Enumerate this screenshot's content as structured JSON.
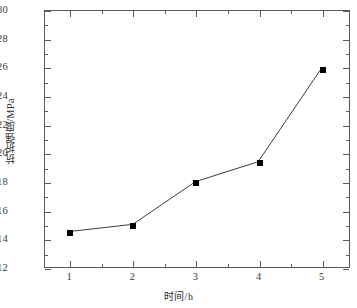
{
  "chart_data": {
    "type": "line",
    "title": "",
    "xlabel": "时间/h",
    "ylabel": "抗折强度/MPa",
    "x": [
      1,
      2,
      3,
      4,
      5
    ],
    "values": [
      14.5,
      15.0,
      18.0,
      19.4,
      25.9
    ],
    "series": [
      {
        "name": "抗折强度",
        "values": [
          14.5,
          15.0,
          18.0,
          19.4,
          25.9
        ]
      }
    ],
    "xlim": [
      0.6,
      5.45
    ],
    "ylim": [
      12,
      30
    ],
    "x_ticks": [
      1,
      2,
      3,
      4,
      5
    ],
    "x_tick_labels": [
      "1",
      "2",
      "3",
      "4",
      "5"
    ],
    "x_minor_ticks": [
      1.5,
      2.5,
      3.5,
      4.5
    ],
    "y_ticks": [
      12,
      14,
      16,
      18,
      20,
      22,
      24,
      26,
      28,
      30
    ],
    "y_tick_labels": [
      "12",
      "14",
      "16",
      "18",
      "20",
      "22",
      "24",
      "26",
      "28",
      "30"
    ],
    "y_minor_ticks": [
      13,
      15,
      17,
      19,
      21,
      23,
      25,
      27,
      29
    ],
    "grid": false,
    "legend": false,
    "legend_position": "none",
    "marker": "square",
    "marker_color": "#000000",
    "line_color": "#3c3c3c",
    "background_color": "#ffffff",
    "frame_color": "#5a5a5a"
  }
}
